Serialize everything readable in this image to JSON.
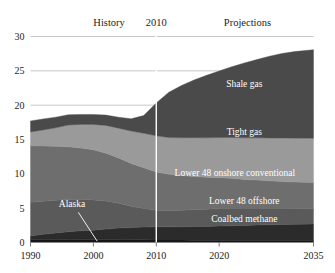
{
  "chart_data": {
    "type": "area",
    "title": "",
    "subtitle": "",
    "xlabel": "",
    "ylabel": "",
    "stacked": true,
    "grid": true,
    "legend_position": "inline-annotations",
    "xlim": [
      1990,
      2035
    ],
    "ylim": [
      0,
      30
    ],
    "xticks": [
      1990,
      2000,
      2010,
      2020,
      2035
    ],
    "xticklabels": [
      "1990",
      "2000",
      "2010",
      "2020",
      "2035"
    ],
    "yticks": [
      0,
      5,
      10,
      15,
      20,
      25,
      30
    ],
    "yticklabels": [
      "0",
      "5",
      "10",
      "15",
      "20",
      "25",
      "30"
    ],
    "annotations": [
      {
        "name": "history-label",
        "text": "History",
        "x": 2002.5,
        "y": 31.6
      },
      {
        "name": "divider-year-label",
        "text": "2010",
        "x": 2010,
        "y": 31.6
      },
      {
        "name": "projections-label",
        "text": "Projections",
        "x": 2024.5,
        "y": 31.6
      }
    ],
    "divider_x": 2010,
    "x": [
      1990,
      1992,
      1994,
      1996,
      1998,
      2000,
      2002,
      2004,
      2006,
      2008,
      2010,
      2012,
      2014,
      2016,
      2018,
      2020,
      2022,
      2024,
      2026,
      2028,
      2030,
      2032,
      2035
    ],
    "series": [
      {
        "name": "Alaska",
        "label": "Alaska",
        "color": "#151515",
        "label_color": "#ffffff",
        "values": [
          0.45,
          0.45,
          0.45,
          0.45,
          0.45,
          0.45,
          0.45,
          0.45,
          0.42,
          0.4,
          0.38,
          0.36,
          0.35,
          0.34,
          0.34,
          0.34,
          0.34,
          0.34,
          0.34,
          0.33,
          0.33,
          0.33,
          0.33
        ]
      },
      {
        "name": "Coalbed methane",
        "label": "Coalbed methane",
        "color": "#2b2b2b",
        "label_color": "#ffffff",
        "values": [
          0.5,
          0.75,
          0.95,
          1.1,
          1.25,
          1.35,
          1.5,
          1.65,
          1.75,
          1.85,
          1.9,
          1.92,
          1.95,
          1.98,
          2.0,
          2.05,
          2.1,
          2.15,
          2.2,
          2.25,
          2.3,
          2.32,
          2.35
        ]
      },
      {
        "name": "Lower 48 offshore",
        "label": "Lower 48 offshore",
        "color": "#5a5a5a",
        "label_color": "#ffffff",
        "values": [
          4.9,
          4.8,
          4.75,
          4.7,
          4.6,
          4.4,
          4.1,
          3.6,
          3.1,
          2.7,
          2.4,
          2.35,
          2.4,
          2.45,
          2.5,
          2.55,
          2.55,
          2.5,
          2.45,
          2.4,
          2.35,
          2.3,
          2.25
        ]
      },
      {
        "name": "Lower 48 onshore conventional",
        "label": "Lower 48 onshore conventional",
        "color": "#6e6e6e",
        "label_color": "#ffffff",
        "values": [
          8.2,
          8.05,
          7.85,
          7.7,
          7.45,
          7.3,
          6.95,
          6.6,
          6.25,
          5.95,
          5.6,
          5.3,
          5.05,
          4.85,
          4.65,
          4.5,
          4.35,
          4.2,
          4.1,
          4.0,
          3.9,
          3.85,
          3.8
        ]
      },
      {
        "name": "Tight gas",
        "label": "Tight gas",
        "color": "#9a9a9a",
        "label_color": "#ffffff",
        "values": [
          2.05,
          2.35,
          2.7,
          3.15,
          3.45,
          3.7,
          4.05,
          4.35,
          4.7,
          5.0,
          5.25,
          5.35,
          5.5,
          5.65,
          5.75,
          5.85,
          5.95,
          6.05,
          6.15,
          6.25,
          6.35,
          6.4,
          6.45
        ]
      },
      {
        "name": "Shale gas",
        "label": "Shale gas",
        "color": "#4a4a4a",
        "label_color": "#ffffff",
        "values": [
          1.6,
          1.6,
          1.55,
          1.5,
          1.45,
          1.45,
          1.5,
          1.6,
          1.8,
          2.6,
          4.8,
          6.6,
          7.6,
          8.4,
          9.1,
          9.7,
          10.3,
          10.9,
          11.4,
          11.9,
          12.3,
          12.6,
          12.9
        ]
      }
    ],
    "band_label_positions": [
      {
        "name": "shale-gas-label",
        "series": "Shale gas",
        "x": 2024.0,
        "y": 22.6
      },
      {
        "name": "tight-gas-label",
        "series": "Tight gas",
        "x": 2024.0,
        "y": 15.6
      },
      {
        "name": "lower48-onshore-label",
        "series": "Lower 48 onshore conventional",
        "x": 2022.5,
        "y": 9.7
      },
      {
        "name": "lower48-offshore-label",
        "series": "Lower 48 offshore",
        "x": 2024.0,
        "y": 5.6
      },
      {
        "name": "coalbed-methane-label",
        "series": "Coalbed methane",
        "x": 2024.0,
        "y": 3.0
      },
      {
        "name": "alaska-label",
        "series": "Alaska",
        "x": 1996.6,
        "y": 5.2
      }
    ],
    "alaska_leader": {
      "x1": 1997.6,
      "y1": 4.4,
      "x2": 2000.6,
      "y2": 0.2
    }
  }
}
